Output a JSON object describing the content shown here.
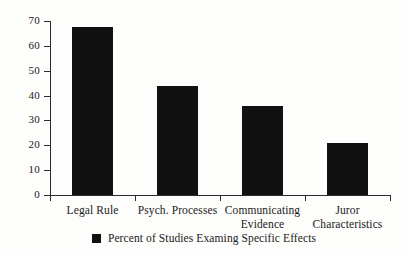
{
  "chart_data": {
    "type": "bar",
    "title": "",
    "subtitle": "",
    "xlabel": "",
    "ylabel": "",
    "categories": [
      "Legal Rule",
      "Psych. Processes",
      "Communicating Evidence",
      "Juror Characteristics"
    ],
    "category_lines": [
      [
        "Legal Rule"
      ],
      [
        "Psych. Processes"
      ],
      [
        "Communicating",
        "Evidence"
      ],
      [
        "Juror",
        "Characteristics"
      ]
    ],
    "values": [
      67.5,
      44,
      36,
      21
    ],
    "ylim": [
      0,
      70
    ],
    "yticks": [
      0,
      10,
      20,
      30,
      40,
      50,
      60,
      70
    ],
    "ytick_labels": [
      "0",
      "10",
      "20",
      "30",
      "40",
      "50",
      "60",
      "70"
    ],
    "grid": false,
    "legend_position": "bottom",
    "legend": [
      {
        "label": "Percent of Studies Examing Specific Effects",
        "color": "#111111"
      }
    ],
    "series": [
      {
        "name": "Percent of Studies Examing Specific Effects",
        "color": "#111111",
        "values": [
          67.5,
          44,
          36,
          21
        ]
      }
    ],
    "colors": {
      "bar": "#111111",
      "axis": "#2a2a2a",
      "text": "#1a1a1a",
      "background": "#fdfdfb"
    }
  }
}
